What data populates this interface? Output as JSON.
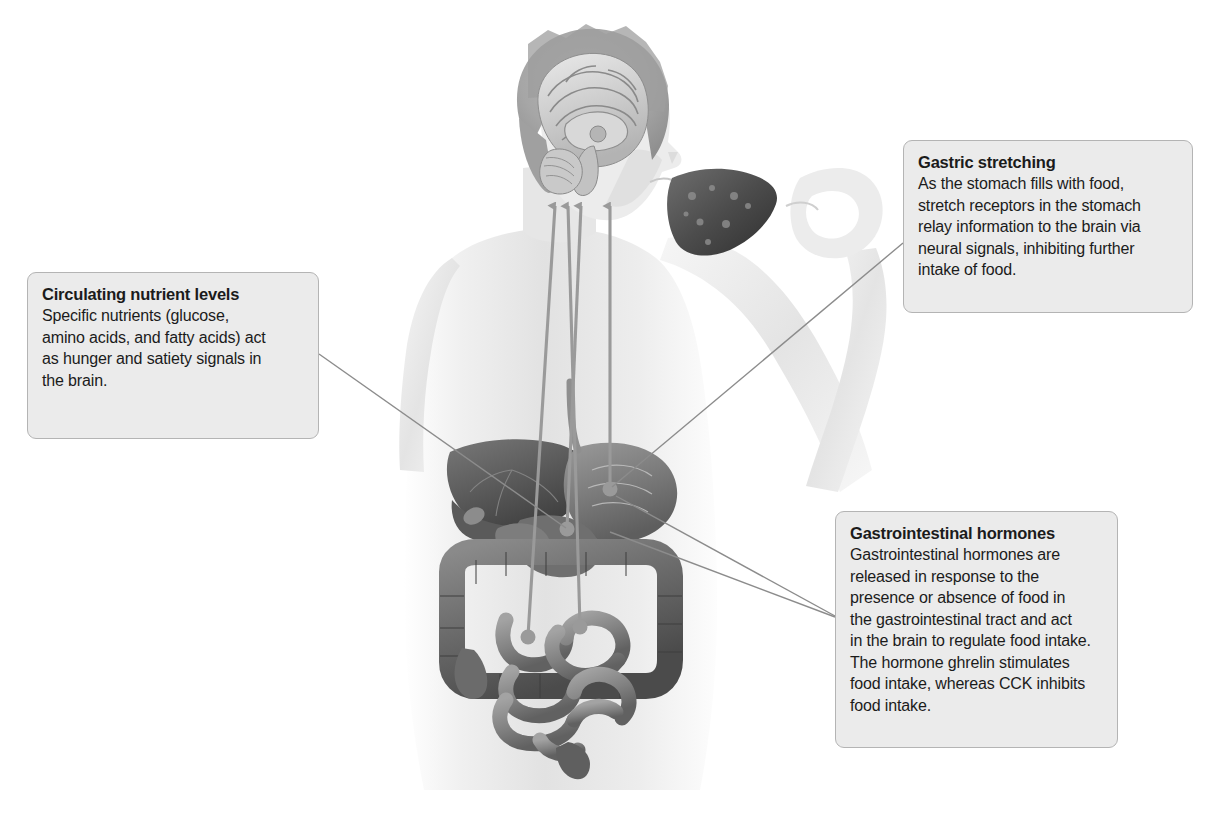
{
  "figure": {
    "kind": "annotated-anatomical-diagram",
    "background_color": "#ffffff"
  },
  "callouts": [
    {
      "id": "circulating-nutrient-levels",
      "title": "Circulating nutrient levels",
      "body": "Specific nutrients (glucose,\namino acids, and fatty acids) act\nas hunger and satiety signals in\nthe brain.",
      "box_color": "#ebebeb",
      "border_color": "#b4b4b4",
      "text_color": "#1b1b1b"
    },
    {
      "id": "gastric-stretching",
      "title": "Gastric stretching",
      "body": "As the stomach fills with food,\nstretch receptors in the stomach\nrelay information to the brain via\nneural signals, inhibiting further\nintake of food.",
      "box_color": "#ebebeb",
      "border_color": "#b4b4b4",
      "text_color": "#1b1b1b"
    },
    {
      "id": "gastrointestinal-hormones",
      "title": "Gastrointestinal hormones",
      "body": "Gastrointestinal hormones are\nreleased in response to the\npresence or absence of food in\nthe gastrointestinal tract and act\nin the brain to regulate food intake.\nThe hormone ghrelin stimulates\nfood intake, whereas CCK inhibits\nfood intake.",
      "box_color": "#ebebeb",
      "border_color": "#b4b4b4",
      "text_color": "#1b1b1b"
    }
  ],
  "illustration": {
    "figure_description": "Grayscale drawing of a person holding a piece of food to the mouth, with a mid-sagittal section of the brain shown in the head and the digestive organs (liver, stomach, small intestine, large intestine) shown in the abdomen.",
    "signal_arrows": {
      "count": 4,
      "direction": "upward, toward the brain",
      "origins": [
        "stomach",
        "duodenum",
        "small intestine",
        "small intestine"
      ],
      "color": "#9a9a9a"
    },
    "organs_shown": [
      "brain",
      "liver",
      "stomach",
      "duodenum",
      "small intestine",
      "large intestine"
    ]
  },
  "leader_lines": {
    "color": "#8c8c8c",
    "connections": [
      {
        "from": "circulating-nutrient-levels",
        "to": "liver / circulation"
      },
      {
        "from": "gastric-stretching",
        "to": "stomach"
      },
      {
        "from": "gastrointestinal-hormones",
        "to": "stomach"
      },
      {
        "from": "gastrointestinal-hormones",
        "to": "small intestine"
      }
    ]
  }
}
